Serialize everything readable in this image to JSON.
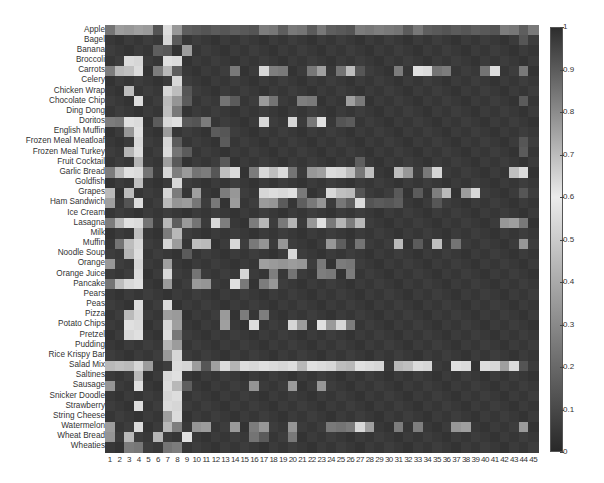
{
  "chart_data": {
    "type": "heatmap",
    "title": "",
    "xlabel": "",
    "ylabel": "",
    "rows": [
      "Apple",
      "Bagel",
      "Banana",
      "Broccoli",
      "Carrots",
      "Celery",
      "Chicken Wrap",
      "Chocolate Chip",
      "Ding Dong",
      "Doritos",
      "English Muffin",
      "Frozen Meal Meatloaf",
      "Frozen Meal Turkey",
      "Fruit Cocktail",
      "Garlic Bread",
      "Goldfish",
      "Grapes",
      "Ham Sandwich",
      "Ice Cream",
      "Lasagna",
      "Milk",
      "Muffin",
      "Noodle Soup",
      "Orange",
      "Orange Juice",
      "Pancake",
      "Pears",
      "Peas",
      "Pizza",
      "Potato Chips",
      "Pretzel",
      "Pudding",
      "Rice Krispy Bar",
      "Salad Mix",
      "Saltines",
      "Sausage",
      "Snicker Doodle",
      "Strawberry",
      "String Cheese",
      "Watermelon",
      "Wheat Bread",
      "Wheaties"
    ],
    "columns": [
      "1",
      "2",
      "3",
      "4",
      "5",
      "6",
      "7",
      "8",
      "9",
      "10",
      "11",
      "12",
      "13",
      "14",
      "15",
      "16",
      "17",
      "18",
      "19",
      "20",
      "21",
      "22",
      "23",
      "24",
      "25",
      "26",
      "27",
      "28",
      "29",
      "30",
      "31",
      "32",
      "33",
      "34",
      "35",
      "36",
      "37",
      "38",
      "39",
      "40",
      "41",
      "42",
      "43",
      "44",
      "45"
    ],
    "value_levels": [
      0.05,
      0.15,
      0.25,
      0.35,
      0.45,
      0.55
    ],
    "level_rows": [
      "233331531111111122122121112222212111111112212",
      "000000510000000000000000000000000000000000010",
      "000001103000000000000000000000000000000000000",
      "005500550000000000000000000000000000000000000",
      "244502410000020052200230241000205522000250020",
      "000000050000000000000000000000000000000000000",
      "004000541000000000000000000000000000000000000",
      "000500431000210032002200032000000000000000010",
      "000000420000000000000000000000000000000000000",
      "225501551120000050050250110000000000000000000",
      "003500300001100000000000000000000000000000000",
      "000500510000100000000000000000000000000000010",
      "004500521000000000000000000000000000000000010",
      "000400310000100000000000001000000000000000000",
      "245520523221450254520335542400430250000000450",
      "000400050000000000000000000000000000000000000",
      "404000520300230055552005441000101024035000010",
      "301500433202030033101230215111100010000000000",
      "000000000000000000000000000000000000000000000",
      "245520413205200240240352424000000000000003320",
      "000400240000000000000000000000000000000000000",
      "024500530440050230300003102000401040200000030",
      "004500001000000000050000000000000000000000000",
      "300500300000000033333020220000000000000000000",
      "000500500200005002020022020000000000000000000",
      "245500300330052023000000000000000000000000000",
      "000000000000000000000000000000000000000000000",
      "000500500000000000000000000000000000000000000",
      "004500330000302020000000000000000000000000000",
      "005500530000300500053053520000000000000000000",
      "005500520000000000000000000000000000000000000",
      "000000430000000000000000000000000000000000000",
      "000000350000000000000000000000000000000000000",
      "444530055313545555554555445550445500550553510",
      "000400550000000000000000000000000000000000000",
      "300500541000000300030030000000000000000000000",
      "000000550000000000000000000000000000000000000",
      "000500550000000000000000000000000000000000000",
      "000000350000000000000000000000000000000000000",
      "300500420330030230030002225300202000330000030",
      "304004005000000210020000000000000000000000000",
      "002200220000000000000000000000000000000000000"
    ],
    "colorbar": {
      "ticks": [
        "0",
        "0.1",
        "0.2",
        "0.3",
        "0.4",
        "0.5",
        "0.6",
        "0.7",
        "0.8",
        "0.9",
        "1"
      ],
      "min": 0,
      "max": 1,
      "note": "dark at 0 and 1, lightest near 0.6"
    }
  }
}
